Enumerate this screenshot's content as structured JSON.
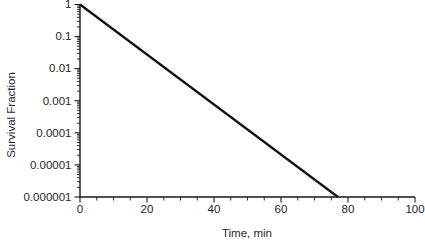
{
  "figure": {
    "background": "#ffffff"
  },
  "colors": {
    "axis": "#1a1a1a",
    "text": "#1f1f1f",
    "line": "#111111"
  },
  "chart_data": {
    "type": "line",
    "title": "",
    "xlabel": "Time, min",
    "ylabel": "Survival Fraction",
    "grid": false,
    "legend": false,
    "x_axis": {
      "scale": "linear",
      "min": 0,
      "max": 100,
      "major_ticks": [
        0,
        20,
        40,
        60,
        80,
        100
      ],
      "tick_labels": [
        "0",
        "20",
        "40",
        "60",
        "80",
        "100"
      ],
      "minor_tick_step": 5
    },
    "y_axis": {
      "scale": "log",
      "min": 1e-06,
      "max": 1,
      "major_ticks": [
        1,
        0.1,
        0.01,
        0.001,
        0.0001,
        1e-05,
        1e-06
      ],
      "tick_labels": [
        "1",
        "0.1",
        "0.01",
        "0.001",
        "0.0001",
        "0.00001",
        "0.000001"
      ],
      "log_minor_ticks": true
    },
    "series": [
      {
        "name": "survival-fraction-line",
        "color": "#111111",
        "stroke_width": 2.2,
        "points": [
          [
            0,
            1
          ],
          [
            77,
            1e-06
          ]
        ]
      }
    ]
  }
}
